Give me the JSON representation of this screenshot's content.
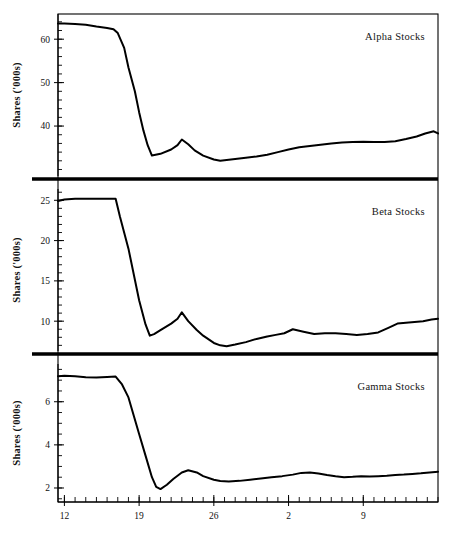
{
  "figure": {
    "width": 453,
    "height": 542,
    "background": "#ffffff",
    "line_color": "#000000"
  },
  "chart_data": {
    "type": "line",
    "title": "",
    "xlabel": "",
    "ylabel": "Shares ('000s)",
    "grid": false,
    "legend": "none",
    "x_axis": {
      "tick_labels": [
        "12",
        "19",
        "26",
        "2",
        "9"
      ],
      "tick_values": [
        12,
        19,
        26,
        33,
        40
      ],
      "minor_tick_step": 1,
      "xlim": [
        11.4,
        47.0
      ]
    },
    "panels": [
      {
        "name": "Alpha Stocks",
        "label": "Alpha Stocks",
        "ylabel": "Shares ('000s)",
        "ylim": [
          28.5,
          65.8
        ],
        "y_ticks": [
          40,
          50,
          60
        ],
        "y_minor_step": 2,
        "x": [
          11.4,
          12,
          13,
          14,
          15,
          16,
          16.6,
          17,
          17.6,
          18,
          18.6,
          19,
          19.4,
          19.8,
          20.2,
          21,
          22,
          22.6,
          23,
          23.6,
          24.2,
          25,
          26,
          26.6,
          27.2,
          28,
          29,
          30,
          31,
          32,
          33,
          34,
          35,
          36,
          37,
          38,
          39,
          40,
          41,
          42,
          43,
          44,
          45,
          45.8,
          46.6,
          47
        ],
        "y": [
          63.6,
          63.6,
          63.5,
          63.3,
          62.9,
          62.6,
          62.3,
          61.4,
          58.0,
          53.5,
          48.0,
          43.2,
          39.0,
          35.6,
          33.2,
          33.6,
          34.6,
          35.6,
          36.9,
          35.8,
          34.4,
          33.2,
          32.3,
          32.0,
          32.2,
          32.4,
          32.7,
          33.0,
          33.4,
          34.0,
          34.6,
          35.1,
          35.4,
          35.7,
          36.0,
          36.2,
          36.3,
          36.4,
          36.3,
          36.3,
          36.5,
          37.0,
          37.6,
          38.3,
          38.8,
          38.3
        ]
      },
      {
        "name": "Beta Stocks",
        "label": "Beta Stocks",
        "ylabel": "Shares ('000s)",
        "ylim": [
          6.3,
          26.4
        ],
        "y_ticks": [
          10,
          15,
          20,
          25
        ],
        "y_minor_step": 1,
        "x": [
          11.4,
          12,
          13,
          14,
          15,
          16,
          16.8,
          17.2,
          18,
          19,
          19.6,
          20.0,
          20.4,
          21,
          22,
          22.6,
          23,
          23.6,
          24.4,
          25,
          26,
          26.6,
          27.2,
          28,
          29,
          30,
          31,
          31.8,
          32.6,
          33.4,
          34.4,
          35.4,
          36.4,
          37.4,
          38.4,
          39.4,
          40.4,
          41.4,
          42.4,
          43.2,
          44,
          44.8,
          45.6,
          46.4,
          47
        ],
        "y": [
          24.9,
          25.1,
          25.2,
          25.2,
          25.2,
          25.2,
          25.2,
          23.0,
          19.0,
          12.6,
          9.6,
          8.2,
          8.4,
          8.9,
          9.7,
          10.3,
          11.1,
          10.0,
          8.9,
          8.2,
          7.3,
          7.0,
          6.9,
          7.1,
          7.4,
          7.8,
          8.1,
          8.3,
          8.5,
          9.0,
          8.7,
          8.4,
          8.5,
          8.5,
          8.4,
          8.3,
          8.4,
          8.6,
          9.2,
          9.7,
          9.8,
          9.9,
          10.0,
          10.2,
          10.3
        ]
      },
      {
        "name": "Gamma Stocks",
        "label": "Gamma Stocks",
        "ylabel": "Shares ('000s)",
        "ylim": [
          1.35,
          7.75
        ],
        "y_ticks": [
          2,
          4,
          6
        ],
        "y_minor_step": 0.5,
        "x": [
          11.4,
          12,
          13,
          14,
          15,
          16,
          16.8,
          17.4,
          18,
          19,
          19.6,
          20.2,
          20.6,
          21,
          21.6,
          22.2,
          23,
          23.6,
          24.4,
          25,
          26,
          26.6,
          27.4,
          28.4,
          29.4,
          30.4,
          31.4,
          32.4,
          33.4,
          34.2,
          35,
          35.8,
          36.6,
          37.4,
          38.2,
          39,
          39.8,
          40.6,
          41.4,
          42.2,
          43,
          43.8,
          44.6,
          45.4,
          46.2,
          47
        ],
        "y": [
          7.18,
          7.2,
          7.18,
          7.14,
          7.12,
          7.15,
          7.17,
          6.8,
          6.2,
          4.5,
          3.5,
          2.5,
          2.05,
          1.95,
          2.15,
          2.42,
          2.72,
          2.82,
          2.72,
          2.55,
          2.38,
          2.32,
          2.3,
          2.33,
          2.38,
          2.44,
          2.5,
          2.55,
          2.62,
          2.7,
          2.72,
          2.67,
          2.6,
          2.54,
          2.5,
          2.52,
          2.55,
          2.53,
          2.55,
          2.57,
          2.6,
          2.62,
          2.65,
          2.68,
          2.72,
          2.75
        ]
      }
    ]
  }
}
